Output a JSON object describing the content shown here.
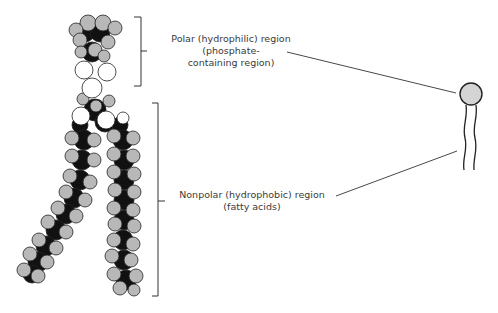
{
  "diagram": {
    "labels": {
      "polar": {
        "line1": "Polar (hydrophilic) region",
        "line2": "(phosphate-",
        "line3": "containing region)"
      },
      "nonpolar": {
        "line1": "Nonpolar (hydrophobic) region",
        "line2": "(fatty acids)"
      }
    },
    "icons": {
      "space_filling_model": "phospholipid-space-filling-model",
      "schematic": "phospholipid-schematic-head-and-tails"
    },
    "colors": {
      "atom_gray": "#b8b8b8",
      "atom_black": "#111111",
      "atom_white": "#ffffff",
      "head_fill": "#d4d4d4",
      "line": "#333333",
      "text": "#3a3a3a"
    }
  }
}
